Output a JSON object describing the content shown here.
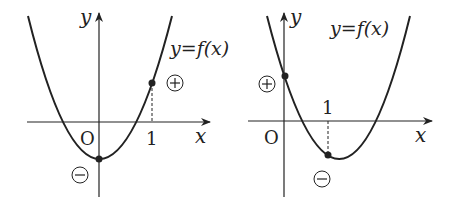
{
  "graphs": [
    {
      "id": "left",
      "axis_x_label": "x",
      "axis_y_label": "y",
      "origin_label": "O",
      "tick_label": "1",
      "curve_label": "y=f(x)",
      "sign_at_zero": "⊖",
      "sign_at_one": "⊕",
      "sign_zero_text": "−",
      "sign_one_text": "+"
    },
    {
      "id": "right",
      "axis_x_label": "x",
      "axis_y_label": "y",
      "origin_label": "O",
      "tick_label": "1",
      "curve_label": "y=f(x)",
      "sign_zero_text": "+",
      "sign_one_text": "−"
    }
  ],
  "colors": {
    "ink": "#222222",
    "background": "#ffffff"
  }
}
